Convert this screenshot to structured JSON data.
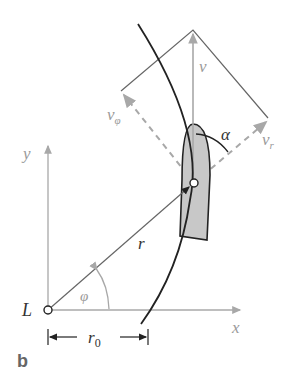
{
  "diagram": {
    "panel_label": "b",
    "origin_label": "L",
    "axes": {
      "x": "x",
      "y": "y"
    },
    "vectors": {
      "v": "v",
      "v_phi": "v",
      "v_phi_sub": "φ",
      "v_r": "v",
      "v_r_sub": "r"
    },
    "radius_label": "r",
    "angle_phi": "φ",
    "angle_alpha": "α",
    "r0_label": "r",
    "r0_sub": "0",
    "colors": {
      "boat_fill": "#c8c8c8",
      "line_dark": "#222222",
      "vector_gray": "#a8a8a8",
      "construction": "#666666"
    }
  }
}
